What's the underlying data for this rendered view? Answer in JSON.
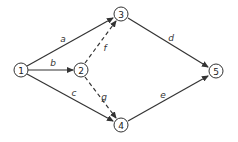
{
  "diagram": {
    "type": "activity-network",
    "nodes": [
      {
        "id": "1",
        "label": "1",
        "x": 21,
        "y": 70
      },
      {
        "id": "2",
        "label": "2",
        "x": 81,
        "y": 70
      },
      {
        "id": "3",
        "label": "3",
        "x": 121,
        "y": 14
      },
      {
        "id": "4",
        "label": "4",
        "x": 121,
        "y": 125
      },
      {
        "id": "5",
        "label": "5",
        "x": 216,
        "y": 71
      }
    ],
    "edges": [
      {
        "from": "1",
        "to": "3",
        "label": "a",
        "style": "solid"
      },
      {
        "from": "1",
        "to": "2",
        "label": "b",
        "style": "solid"
      },
      {
        "from": "1",
        "to": "4",
        "label": "c",
        "style": "solid"
      },
      {
        "from": "3",
        "to": "5",
        "label": "d",
        "style": "solid"
      },
      {
        "from": "4",
        "to": "5",
        "label": "e",
        "style": "solid"
      },
      {
        "from": "2",
        "to": "3",
        "label": "f",
        "style": "dashed"
      },
      {
        "from": "2",
        "to": "4",
        "label": "g",
        "style": "dashed"
      }
    ]
  },
  "labels": {
    "n1": "1",
    "n2": "2",
    "n3": "3",
    "n4": "4",
    "n5": "5",
    "a": "a",
    "b": "b",
    "c": "c",
    "d": "d",
    "e": "e",
    "f": "f",
    "g": "g"
  }
}
